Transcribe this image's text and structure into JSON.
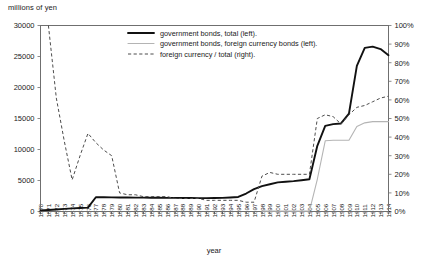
{
  "chart_data": {
    "type": "line",
    "title": "",
    "ylabel": "millions of yen",
    "xlabel": "year",
    "ylabel_right": "",
    "grid": false,
    "legend_position": "top-center",
    "ylim": [
      0,
      30000
    ],
    "ylim_right": [
      0,
      100
    ],
    "xlim": [
      1870,
      1914
    ],
    "yticks": [
      0,
      5000,
      10000,
      15000,
      20000,
      25000,
      30000
    ],
    "ytick_labels": [
      "0",
      "5000",
      "10000",
      "15000",
      "20000",
      "25000",
      "30000"
    ],
    "yticks_right": [
      0,
      10,
      20,
      30,
      40,
      50,
      60,
      70,
      80,
      90,
      100
    ],
    "ytick_labels_right": [
      "0%",
      "10%",
      "20%",
      "30%",
      "40%",
      "50%",
      "60%",
      "70%",
      "80%",
      "90%",
      "100%"
    ],
    "x": [
      1870,
      1871,
      1872,
      1873,
      1874,
      1875,
      1876,
      1877,
      1878,
      1879,
      1880,
      1881,
      1882,
      1883,
      1884,
      1885,
      1886,
      1887,
      1888,
      1889,
      1890,
      1891,
      1892,
      1893,
      1894,
      1895,
      1896,
      1897,
      1898,
      1899,
      1900,
      1901,
      1902,
      1903,
      1904,
      1905,
      1906,
      1907,
      1908,
      1909,
      1910,
      1911,
      1912,
      1913,
      1914
    ],
    "xtick_labels": [
      "1870",
      "1871",
      "1872",
      "1873",
      "1874",
      "1875",
      "1876",
      "1877",
      "1878",
      "1879",
      "1880",
      "1881",
      "1882",
      "1883",
      "1884",
      "1885",
      "1886",
      "1887",
      "1888",
      "1889",
      "1890",
      "1891",
      "1892",
      "1893",
      "1894",
      "1895",
      "1896",
      "1897",
      "1898",
      "1899",
      "1900",
      "1901",
      "1902",
      "1903",
      "1904",
      "1905",
      "1906",
      "1907",
      "1908",
      "1909",
      "1910",
      "1911",
      "1912",
      "1913",
      "1914"
    ],
    "series": [
      {
        "name": "government bonds, total (left).",
        "axis": "left",
        "style": "solid-thick",
        "color": "#111111",
        "values": [
          180,
          250,
          330,
          420,
          500,
          560,
          620,
          2300,
          2300,
          2280,
          2260,
          2250,
          2240,
          2230,
          2220,
          2210,
          2200,
          2190,
          2180,
          2170,
          2160,
          2160,
          2170,
          2200,
          2260,
          2340,
          2900,
          3600,
          4100,
          4400,
          4700,
          4800,
          4900,
          5050,
          5200,
          10600,
          13800,
          14100,
          14200,
          15800,
          23500,
          26400,
          26600,
          26200,
          25200
        ]
      },
      {
        "name": "government bonds, foreign currency bonds (left).",
        "axis": "left",
        "style": "solid-thin",
        "color": "#b4b4b4",
        "values": [
          null,
          null,
          null,
          null,
          null,
          null,
          null,
          null,
          null,
          null,
          null,
          null,
          null,
          null,
          null,
          null,
          null,
          null,
          null,
          null,
          null,
          null,
          null,
          null,
          null,
          null,
          null,
          null,
          60,
          60,
          60,
          60,
          60,
          60,
          60,
          5200,
          11400,
          11500,
          11500,
          11500,
          13700,
          14300,
          14500,
          14500,
          14500
        ]
      },
      {
        "name": "foreign currency / total (right).",
        "axis": "right",
        "style": "dashed",
        "color": "#4d4d4d",
        "values": [
          null,
          100,
          61,
          38,
          17,
          30,
          42,
          37,
          33,
          30,
          10,
          9,
          9,
          8,
          8,
          8,
          8,
          7,
          7,
          7,
          7,
          6,
          6,
          6,
          6,
          6,
          5,
          5,
          19,
          21,
          20,
          20,
          20,
          20,
          20,
          50,
          52,
          51,
          47,
          52,
          56,
          57,
          59,
          61,
          62
        ]
      }
    ],
    "annotations": []
  },
  "legend": {
    "entries": [
      {
        "label": "government bonds, total (left)."
      },
      {
        "label": "government bonds, foreign currency bonds (left)."
      },
      {
        "label": "foreign currency / total (right)."
      }
    ]
  }
}
